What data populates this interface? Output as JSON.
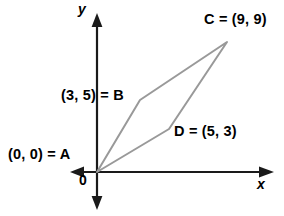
{
  "figure": {
    "type": "coordinate-geometry-diagram",
    "background_color": "#ffffff",
    "shape_color": "#999999",
    "axis_color": "#1a1a1a",
    "text_color": "#000000"
  },
  "axes": {
    "x_label": "x",
    "y_label": "y",
    "origin_label": "0",
    "origin_px": {
      "x": 97,
      "y": 172
    },
    "units_per_pixel": 14.4,
    "x_axis": {
      "from_px": 72,
      "to_px": 272,
      "arrows": [
        "left",
        "right"
      ]
    },
    "y_axis": {
      "from_px": 14,
      "to_px": 208,
      "arrows": [
        "up",
        "down"
      ]
    }
  },
  "points": [
    {
      "name": "A",
      "coords": "(0, 0)",
      "label": "(0, 0) = A",
      "x": 0,
      "y": 0,
      "px": {
        "x": 97,
        "y": 172
      }
    },
    {
      "name": "B",
      "coords": "(3, 5)",
      "label": "(3, 5) = B",
      "x": 3,
      "y": 5,
      "px": {
        "x": 140,
        "y": 100
      }
    },
    {
      "name": "C",
      "coords": "(9, 9)",
      "label": "C = (9, 9)",
      "x": 9,
      "y": 9,
      "px": {
        "x": 227,
        "y": 42
      }
    },
    {
      "name": "D",
      "coords": "(5, 3)",
      "label": "D = (5, 3)",
      "x": 5,
      "y": 3,
      "px": {
        "x": 169,
        "y": 129
      }
    }
  ],
  "polygon": {
    "name": "parallelogram-ABCD",
    "vertex_order": [
      "A",
      "B",
      "C",
      "D"
    ],
    "stroke": "#999999",
    "stroke_width": 2,
    "filled": false
  }
}
